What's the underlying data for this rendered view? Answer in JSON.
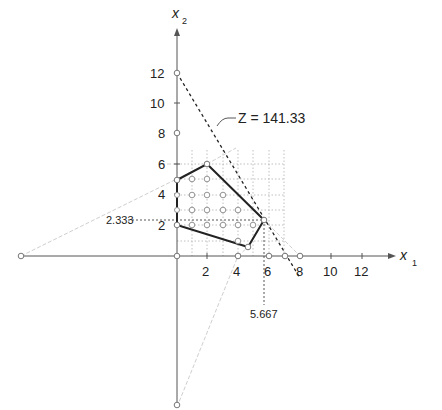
{
  "diagram": {
    "axes": {
      "x_label": "x",
      "x_sub": "1",
      "y_label": "x",
      "y_sub": "2",
      "x_ticks": [
        "2",
        "4",
        "6",
        "8",
        "10",
        "12"
      ],
      "y_ticks": [
        "2",
        "4",
        "6",
        "8",
        "10",
        "12"
      ]
    },
    "objective_label": "Z = 141.33",
    "annotations": {
      "x_opt": "5.667",
      "y_opt": "2.333"
    },
    "polygon_vertices": [
      [
        0,
        5
      ],
      [
        2,
        6
      ],
      [
        5.667,
        2.333
      ],
      [
        4.667,
        0.667
      ],
      [
        0,
        2
      ]
    ],
    "optimal_point": [
      5.667,
      2.333
    ],
    "objective_line": {
      "from": [
        0,
        12
      ],
      "to": [
        8,
        0
      ]
    },
    "colors": {
      "axis": "#555555",
      "polygon": "#222222",
      "grid": "#aaaaaa",
      "construction": "#cccccc"
    }
  }
}
